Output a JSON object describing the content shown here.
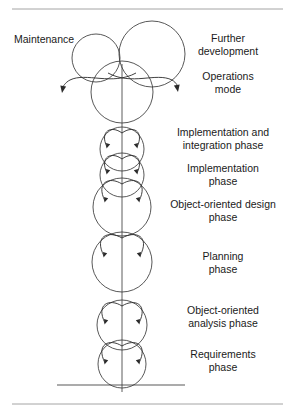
{
  "figure": {
    "rules": {
      "top_y": 9,
      "bottom_y": 404,
      "x_start": 12,
      "x_end": 283
    },
    "baseline": {
      "y": 385,
      "x_start": 57,
      "x_end": 185,
      "label": "ground-baseline"
    },
    "axis": {
      "x": 122,
      "y_top": 64,
      "y_bottom": 392
    }
  },
  "labels": {
    "maintenance": "Maintenance",
    "further_development": "Further\ndevelopment",
    "operations_mode": "Operations\nmode",
    "implementation_integration": "Implementation and\nintegration phase",
    "implementation": "Implementation\nphase",
    "ood": "Object-oriented design\nphase",
    "planning": "Planning\nphase",
    "ooa": "Object-oriented\nanalysis phase",
    "requirements": "Requirements\nphase"
  },
  "label_positions": {
    "maintenance": {
      "left": 14,
      "top": 33,
      "width": 80,
      "align": "left"
    },
    "further_development": {
      "left": 168,
      "top": 32,
      "width": 120,
      "align": "center"
    },
    "operations_mode": {
      "left": 168,
      "top": 70,
      "width": 120,
      "align": "center"
    },
    "implementation_integration": {
      "left": 156,
      "top": 126,
      "width": 134,
      "align": "center"
    },
    "implementation": {
      "left": 156,
      "top": 162,
      "width": 134,
      "align": "center"
    },
    "ood": {
      "left": 152,
      "top": 198,
      "width": 142,
      "align": "center"
    },
    "planning": {
      "left": 156,
      "top": 250,
      "width": 134,
      "align": "center"
    },
    "ooa": {
      "left": 156,
      "top": 304,
      "width": 134,
      "align": "center"
    },
    "requirements": {
      "left": 156,
      "top": 348,
      "width": 134,
      "align": "center"
    }
  },
  "circles": [
    {
      "name": "maintenance-circle",
      "cx": 96,
      "cy": 58,
      "r": 24
    },
    {
      "name": "further-development-circle",
      "cx": 152,
      "cy": 54,
      "r": 33
    },
    {
      "name": "operations-mode-circle",
      "cx": 122,
      "cy": 92,
      "r": 31
    },
    {
      "name": "implementation-integration-circle",
      "cx": 122,
      "cy": 149,
      "r": 22
    },
    {
      "name": "implementation-circle",
      "cx": 122,
      "cy": 175,
      "r": 22
    },
    {
      "name": "object-oriented-design-circle",
      "cx": 122,
      "cy": 207,
      "r": 29
    },
    {
      "name": "planning-circle",
      "cx": 122,
      "cy": 262,
      "r": 30
    },
    {
      "name": "object-oriented-analysis-circle",
      "cx": 122,
      "cy": 325,
      "r": 25
    },
    {
      "name": "requirements-circle",
      "cx": 122,
      "cy": 364,
      "r": 24
    }
  ],
  "inner_loops": [
    {
      "name": "loop-implementation-integration",
      "cy": 149,
      "r": 22,
      "lobe": 12,
      "depth": 17
    },
    {
      "name": "loop-implementation",
      "cy": 175,
      "r": 22,
      "lobe": 12,
      "depth": 17
    },
    {
      "name": "loop-object-oriented-design",
      "cy": 207,
      "r": 29,
      "lobe": 14,
      "depth": 20
    },
    {
      "name": "loop-planning",
      "cy": 262,
      "r": 30,
      "lobe": 15,
      "depth": 21
    },
    {
      "name": "loop-object-oriented-analysis",
      "cy": 325,
      "r": 25,
      "lobe": 14,
      "depth": 20
    },
    {
      "name": "loop-requirements",
      "cy": 364,
      "r": 24,
      "lobe": 14,
      "depth": 20
    }
  ],
  "outflow_arrows": [
    {
      "name": "maintenance-outflow-arrow",
      "direction": "left",
      "tip_x": 62,
      "tip_y": 93
    },
    {
      "name": "operations-outflow-arrow",
      "direction": "right",
      "tip_x": 178,
      "tip_y": 92
    }
  ],
  "colors": {
    "stroke": "#3a3a3a",
    "arrow": "#2b2b2b",
    "rule": "#9a9a9a",
    "text": "#1a1a1a",
    "background": "#ffffff"
  }
}
